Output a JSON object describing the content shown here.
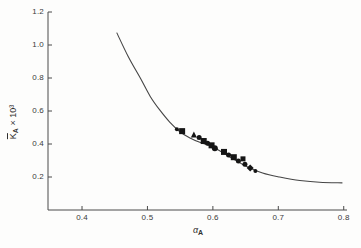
{
  "figure": {
    "width": 361,
    "height": 248,
    "background": "#fdfdfc"
  },
  "colors": {
    "axis": "#4a4a4a",
    "curve": "#454545",
    "marker": "#151515",
    "text": "#3a3a3a"
  },
  "chart_data": {
    "type": "scatter",
    "title": "",
    "xlabel": "αA",
    "ylabel": "K̄A × 10³",
    "xlabel_parts": {
      "main": "α",
      "sub": "A"
    },
    "ylabel_parts": {
      "main": "K",
      "overbar": true,
      "sub": "A",
      "suffix": " × 10³"
    },
    "xlim": [
      0.348,
      0.805
    ],
    "ylim": [
      0,
      1.2
    ],
    "xticks": [
      0.4,
      0.5,
      0.6,
      0.7,
      0.8
    ],
    "yticks": [
      0.2,
      0.4,
      0.6,
      0.8,
      1.0,
      1.2
    ],
    "tick_decimals": 1,
    "grid": false,
    "legend": "none",
    "series": [
      {
        "name": "fitted-curve",
        "type": "line",
        "points": [
          [
            0.453,
            1.075
          ],
          [
            0.47,
            0.935
          ],
          [
            0.489,
            0.8
          ],
          [
            0.504,
            0.69
          ],
          [
            0.519,
            0.605
          ],
          [
            0.534,
            0.533
          ],
          [
            0.55,
            0.473
          ],
          [
            0.565,
            0.437
          ],
          [
            0.58,
            0.41
          ],
          [
            0.6,
            0.381
          ],
          [
            0.626,
            0.321
          ],
          [
            0.65,
            0.267
          ],
          [
            0.676,
            0.224
          ],
          [
            0.702,
            0.2
          ],
          [
            0.733,
            0.179
          ],
          [
            0.763,
            0.168
          ],
          [
            0.798,
            0.164
          ]
        ]
      },
      {
        "name": "experimental-points",
        "type": "scatter",
        "points": [
          {
            "x": 0.545,
            "y": 0.49,
            "shape": "circle",
            "size": 4
          },
          {
            "x": 0.553,
            "y": 0.478,
            "shape": "square",
            "size": 6
          },
          {
            "x": 0.571,
            "y": 0.458,
            "shape": "triangle",
            "size": 6
          },
          {
            "x": 0.579,
            "y": 0.44,
            "shape": "circle",
            "size": 5
          },
          {
            "x": 0.586,
            "y": 0.418,
            "shape": "square",
            "size": 6
          },
          {
            "x": 0.592,
            "y": 0.404,
            "shape": "circle",
            "size": 5
          },
          {
            "x": 0.598,
            "y": 0.392,
            "shape": "square",
            "size": 6
          },
          {
            "x": 0.603,
            "y": 0.374,
            "shape": "circle",
            "size": 6
          },
          {
            "x": 0.617,
            "y": 0.352,
            "shape": "square",
            "size": 6
          },
          {
            "x": 0.624,
            "y": 0.333,
            "shape": "circle",
            "size": 5
          },
          {
            "x": 0.632,
            "y": 0.32,
            "shape": "square",
            "size": 6
          },
          {
            "x": 0.639,
            "y": 0.297,
            "shape": "circle",
            "size": 5
          },
          {
            "x": 0.646,
            "y": 0.31,
            "shape": "square",
            "size": 5
          },
          {
            "x": 0.649,
            "y": 0.277,
            "shape": "circle",
            "size": 5
          },
          {
            "x": 0.657,
            "y": 0.254,
            "shape": "diamond",
            "size": 5
          },
          {
            "x": 0.665,
            "y": 0.237,
            "shape": "circle",
            "size": 4
          }
        ]
      }
    ]
  }
}
